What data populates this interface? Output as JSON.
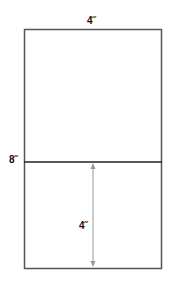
{
  "diagram": {
    "top_width_label": "4˝",
    "left_height_label": "8˝",
    "inner_measure_label": "4˝",
    "colors": {
      "outline": "#555555",
      "divider": "#222222",
      "arrow": "#999999"
    }
  }
}
